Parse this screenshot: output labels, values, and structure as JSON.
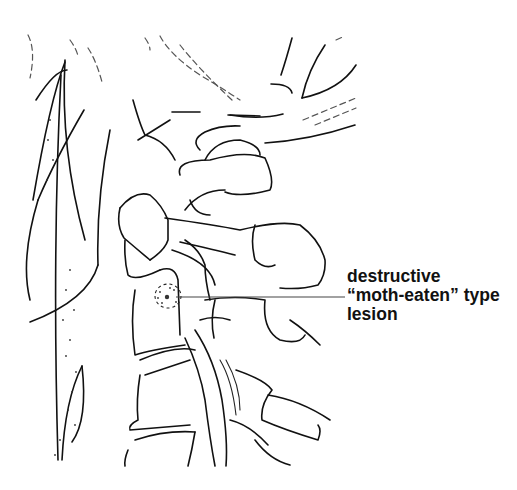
{
  "figure": {
    "background": "#ffffff",
    "line_color": "#111111"
  },
  "annotation": {
    "lines": [
      "destructive",
      "“moth-eaten” type",
      "lesion"
    ],
    "pointer": {
      "from": [
        176,
        297
      ],
      "to": [
        345,
        297
      ]
    }
  }
}
